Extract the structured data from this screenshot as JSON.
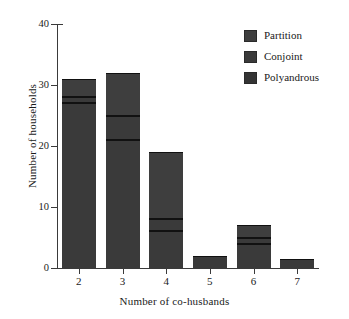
{
  "chart_data": {
    "type": "bar",
    "stacked": true,
    "title": "",
    "subtitle": "",
    "xlabel": "Number of co-husbands",
    "ylabel": "Number of households",
    "categories": [
      "2",
      "3",
      "4",
      "5",
      "6",
      "7"
    ],
    "series": [
      {
        "name": "Polyandrous",
        "color": "#3a3a3a",
        "values": [
          27,
          21,
          6,
          2,
          4,
          1.5
        ]
      },
      {
        "name": "Conjoint",
        "color": "#3a3a3a",
        "values": [
          1,
          4,
          2,
          0,
          1,
          0
        ]
      },
      {
        "name": "Partition",
        "color": "#3e3e3e",
        "values": [
          3,
          7,
          11,
          0,
          2,
          0
        ]
      }
    ],
    "totals": [
      31,
      32,
      19,
      2,
      7,
      1.5
    ],
    "ylim": [
      0,
      40
    ],
    "yticks": [
      "0",
      "10",
      "20",
      "30",
      "40"
    ],
    "ytick_values": [
      0,
      10,
      20,
      30,
      40
    ],
    "xtick_labels": [
      "2",
      "3",
      "4",
      "5",
      "6",
      "7"
    ],
    "grid": false,
    "legend_position": "top-right",
    "legend_entries": [
      {
        "label": "Partition",
        "color": "#3e3e3e"
      },
      {
        "label": "Conjoint",
        "color": "#3a3a3a"
      },
      {
        "label": "Polyandrous",
        "color": "#343434"
      }
    ],
    "axis_color": "#3a3a3a",
    "divider_color": "#111111",
    "background": "#ffffff"
  }
}
